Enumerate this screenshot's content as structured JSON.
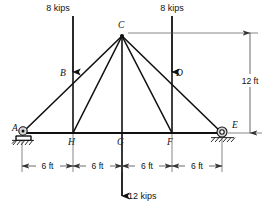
{
  "figure": {
    "units": {
      "length": "ft",
      "force": "kips"
    },
    "geometry": {
      "span_ft": 24,
      "height_ft": 12,
      "panel_ft": 6,
      "panels": 4
    },
    "joints": [
      {
        "id": "A",
        "label": "A",
        "x_ft": 0,
        "y_ft": 0,
        "px": 22,
        "py": 133,
        "label_px": 12,
        "label_py": 131,
        "support": "pin"
      },
      {
        "id": "H",
        "label": "H",
        "x_ft": 6,
        "y_ft": 0,
        "px": 73,
        "py": 133,
        "label_px": 68,
        "label_py": 145,
        "support": "none"
      },
      {
        "id": "G",
        "label": "G",
        "x_ft": 12,
        "y_ft": 0,
        "px": 122,
        "py": 133,
        "label_px": 117,
        "label_py": 145,
        "support": "none"
      },
      {
        "id": "F",
        "label": "F",
        "x_ft": 18,
        "y_ft": 0,
        "px": 172,
        "py": 133,
        "label_px": 167,
        "label_py": 145,
        "support": "none"
      },
      {
        "id": "E",
        "label": "E",
        "x_ft": 24,
        "y_ft": 0,
        "px": 222,
        "py": 133,
        "label_px": 233,
        "label_py": 129,
        "support": "roller"
      },
      {
        "id": "B",
        "label": "B",
        "x_ft": 6,
        "y_ft": 6,
        "px": 73,
        "py": 72,
        "label_px": 62,
        "label_py": 74,
        "support": "none"
      },
      {
        "id": "C",
        "label": "C",
        "x_ft": 12,
        "y_ft": 12,
        "px": 122,
        "py": 36,
        "label_px": 117,
        "label_py": 27,
        "support": "none"
      },
      {
        "id": "D",
        "label": "D",
        "x_ft": 18,
        "y_ft": 6,
        "px": 172,
        "py": 72,
        "label_px": 176,
        "label_py": 74,
        "support": "none"
      }
    ],
    "members": [
      {
        "from": "A",
        "to": "C",
        "kind": "top-chord-left"
      },
      {
        "from": "C",
        "to": "E",
        "kind": "top-chord-right"
      },
      {
        "from": "A",
        "to": "E",
        "kind": "bottom-chord"
      },
      {
        "from": "B",
        "to": "H",
        "kind": "vertical"
      },
      {
        "from": "C",
        "to": "G",
        "kind": "vertical"
      },
      {
        "from": "D",
        "to": "F",
        "kind": "vertical"
      },
      {
        "from": "C",
        "to": "H",
        "kind": "diagonal"
      },
      {
        "from": "C",
        "to": "F",
        "kind": "diagonal"
      }
    ],
    "loads": [
      {
        "id": "load-left",
        "label": "8 kips",
        "magnitude": 8,
        "unit": "kips",
        "at_joint": "B",
        "direction": "down",
        "x_px": 73,
        "y_start_px": 16,
        "y_end_px": 72,
        "text_x_px": 58,
        "text_y_px": 11
      },
      {
        "id": "load-right",
        "label": "8 kips",
        "magnitude": 8,
        "unit": "kips",
        "at_joint": "D",
        "direction": "down",
        "x_px": 172,
        "y_start_px": 16,
        "y_end_px": 72,
        "text_x_px": 157,
        "text_y_px": 11
      },
      {
        "id": "load-bottom",
        "label": "12 kips",
        "magnitude": 12,
        "unit": "kips",
        "at_joint": "G",
        "direction": "down",
        "x_px": 122,
        "y_start_px": 133,
        "y_end_px": 196,
        "text_x_px": 128,
        "text_y_px": 198
      }
    ],
    "dimensions": {
      "horizontal": [
        {
          "id": "dim-a-h",
          "label": "6 ft",
          "value": 6,
          "unit": "ft",
          "x1_px": 22,
          "x2_px": 73,
          "y_px": 166,
          "text_x_px": 47.5,
          "text_y_px": 169
        },
        {
          "id": "dim-h-g",
          "label": "6 ft",
          "value": 6,
          "unit": "ft",
          "x1_px": 73,
          "x2_px": 122,
          "y_px": 166,
          "text_x_px": 97.5,
          "text_y_px": 169
        },
        {
          "id": "dim-g-f",
          "label": "6 ft",
          "value": 6,
          "unit": "ft",
          "x1_px": 122,
          "x2_px": 172,
          "y_px": 166,
          "text_x_px": 147,
          "text_y_px": 169
        },
        {
          "id": "dim-f-e",
          "label": "6 ft",
          "value": 6,
          "unit": "ft",
          "x1_px": 172,
          "x2_px": 222,
          "y_px": 166,
          "text_x_px": 197,
          "text_y_px": 169
        }
      ],
      "vertical": [
        {
          "id": "dim-height",
          "label": "12 ft",
          "value": 12,
          "unit": "ft",
          "x_px": 250,
          "y1_px": 36,
          "y2_px": 133,
          "text_x_px": 254,
          "text_y_px": 82
        }
      ]
    },
    "supports": {
      "pin": {
        "joint": "A",
        "type": "pin",
        "name": "pin-support"
      },
      "roller": {
        "joint": "E",
        "type": "roller",
        "name": "roller-support"
      }
    },
    "colors": {
      "ink": "#111111",
      "dimension": "#444444",
      "support_fill": "#d8d8d8",
      "background": "#ffffff"
    }
  }
}
